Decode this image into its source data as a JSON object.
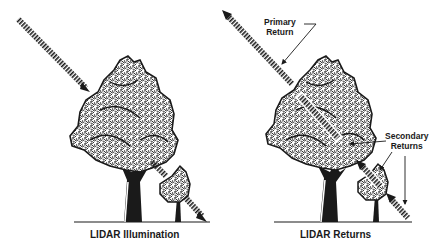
{
  "diagram": {
    "panels": [
      {
        "id": "illumination",
        "caption": "LIDAR Illumination",
        "elements": [
          "laser-beam-incoming",
          "large-tree",
          "small-tree",
          "ground-line"
        ]
      },
      {
        "id": "returns",
        "caption": "LIDAR Returns",
        "elements": [
          "laser-beam-primary-return",
          "laser-beam-secondary-returns",
          "large-tree",
          "small-tree",
          "ground-line"
        ]
      }
    ],
    "annotations": {
      "primary_line1": "Primary",
      "primary_line2": "Return",
      "secondary_line1": "Secondary",
      "secondary_line2": "Returns"
    },
    "colors": {
      "ink": "#1a1a1a",
      "background": "#ffffff"
    }
  }
}
